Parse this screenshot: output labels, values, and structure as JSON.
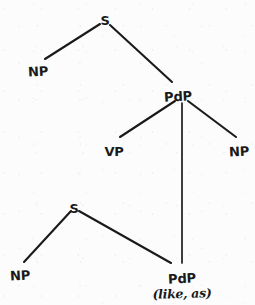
{
  "diagram": {
    "kind": "syntax-tree",
    "ink_color": "#1a1a1a",
    "paper_color": "#fdfdfd",
    "nodes": [
      {
        "id": "s-top",
        "label": "S",
        "x": 105,
        "y": 14
      },
      {
        "id": "np-top",
        "label": "NP",
        "x": 38,
        "y": 65
      },
      {
        "id": "pdp-mid",
        "label": "PdP",
        "x": 178,
        "y": 90
      },
      {
        "id": "vp",
        "label": "VP",
        "x": 114,
        "y": 145
      },
      {
        "id": "np-right",
        "label": "NP",
        "x": 239,
        "y": 145
      },
      {
        "id": "s-lower",
        "label": "S",
        "x": 74,
        "y": 202
      },
      {
        "id": "np-lower",
        "label": "NP",
        "x": 20,
        "y": 269
      },
      {
        "id": "pdp-bottom",
        "label": "PdP",
        "x": 182,
        "y": 272
      }
    ],
    "terminal_gloss": {
      "id": "pdp-bottom-gloss",
      "text": "(like, as)",
      "x": 182,
      "y": 286
    },
    "edges": [
      {
        "id": "edge-s-top-np-top",
        "from": "s-top",
        "to": "np-top",
        "x1": 100,
        "y1": 24,
        "x2": 45,
        "y2": 59,
        "kind": "diagonal"
      },
      {
        "id": "edge-s-top-pdp-mid",
        "from": "s-top",
        "to": "pdp-mid",
        "x1": 110,
        "y1": 25,
        "x2": 172,
        "y2": 82,
        "kind": "diagonal"
      },
      {
        "id": "edge-pdp-mid-vp",
        "from": "pdp-mid",
        "to": "vp",
        "x1": 175,
        "y1": 101,
        "x2": 120,
        "y2": 137,
        "kind": "diagonal"
      },
      {
        "id": "edge-pdp-mid-pdp-bottom",
        "from": "pdp-mid",
        "to": "pdp-bottom",
        "x1": 182,
        "y1": 103,
        "x2": 182,
        "y2": 263,
        "kind": "vertical"
      },
      {
        "id": "edge-pdp-mid-np-right",
        "from": "pdp-mid",
        "to": "np-right",
        "x1": 188,
        "y1": 101,
        "x2": 236,
        "y2": 137,
        "kind": "diagonal"
      },
      {
        "id": "edge-s-lower-np-lower",
        "from": "s-lower",
        "to": "np-lower",
        "x1": 71,
        "y1": 211,
        "x2": 24,
        "y2": 262,
        "kind": "diagonal"
      },
      {
        "id": "edge-s-lower-pdp-bottom",
        "from": "s-lower",
        "to": "pdp-bottom",
        "x1": 79,
        "y1": 211,
        "x2": 171,
        "y2": 263,
        "kind": "diagonal"
      }
    ]
  }
}
